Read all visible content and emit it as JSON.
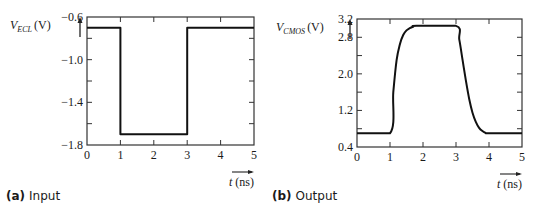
{
  "chart_data": [
    {
      "type": "line",
      "title": "",
      "caption_tag": "(a)",
      "caption": "Input",
      "ylabel_main": "V",
      "ylabel_sub": "ECL",
      "ylabel_unit": "(V)",
      "xlabel": "t (ns)",
      "xlim": [
        0,
        5
      ],
      "ylim": [
        -1.8,
        -0.6
      ],
      "xticks": [
        0,
        1,
        2,
        3,
        4,
        5
      ],
      "xtick_labels": [
        "0",
        "1",
        "2",
        "3",
        "4",
        "5"
      ],
      "yticks": [
        -1.8,
        -1.4,
        -1.0,
        -0.6
      ],
      "ytick_labels": [
        "−1.8",
        "−1.4",
        "−1.0",
        "−0.6"
      ],
      "minor_yticks": [
        -1.6,
        -1.2,
        -0.8
      ],
      "grid": false,
      "series": [
        {
          "name": "V_ECL",
          "x": [
            0,
            1,
            1,
            3,
            3,
            5
          ],
          "y": [
            -0.7,
            -0.7,
            -1.7,
            -1.7,
            -0.7,
            -0.7
          ]
        }
      ]
    },
    {
      "type": "line",
      "title": "",
      "caption_tag": "(b)",
      "caption": "Output",
      "ylabel_main": "V",
      "ylabel_sub": "CMOS",
      "ylabel_unit": "(V)",
      "xlabel": "t (ns)",
      "xlim": [
        0,
        5
      ],
      "ylim": [
        0.4,
        3.2
      ],
      "xticks": [
        0,
        1,
        2,
        3,
        4,
        5
      ],
      "xtick_labels": [
        "0",
        "1",
        "2",
        "3",
        "4",
        "5"
      ],
      "yticks": [
        0.4,
        1.2,
        2.0,
        2.8,
        3.2
      ],
      "ytick_labels": [
        "0.4",
        "1.2",
        "2.0",
        "2.8",
        "3.2"
      ],
      "minor_yticks": [
        0.8,
        1.6,
        2.4
      ],
      "grid": false,
      "series": [
        {
          "name": "V_CMOS",
          "x": [
            0,
            1.0,
            1.1,
            1.2,
            1.3,
            1.4,
            1.5,
            1.6,
            1.7,
            1.8,
            3.0,
            3.1,
            3.2,
            3.3,
            3.4,
            3.5,
            3.6,
            3.7,
            3.8,
            3.9,
            4.0,
            5.0
          ],
          "y": [
            0.7,
            0.7,
            1.6,
            2.3,
            2.65,
            2.85,
            2.95,
            3.0,
            3.03,
            3.05,
            3.05,
            2.75,
            2.3,
            1.85,
            1.45,
            1.15,
            0.95,
            0.82,
            0.75,
            0.71,
            0.7,
            0.7
          ]
        }
      ]
    }
  ]
}
